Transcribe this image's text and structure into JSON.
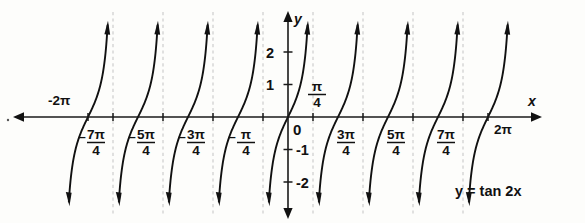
{
  "figure": {
    "title": "",
    "equation_label": "y = tan 2x",
    "axis_labels": {
      "x": "x",
      "y": "y"
    },
    "origin_label": "0"
  },
  "chart_data": {
    "type": "line",
    "title": "",
    "subtitle": "",
    "function": "y = tan 2x",
    "xlabel": "x",
    "ylabel": "y",
    "xlim": [
      -6.9115,
      6.9115
    ],
    "ylim": [
      -2.9,
      2.9
    ],
    "grid": false,
    "legend": null,
    "annotations": [
      "y = tan 2x"
    ],
    "x_ticks": [
      {
        "value": -6.2832,
        "label": "-2π",
        "kind": "whole",
        "sign": "-",
        "text": "2π",
        "on_axis": true
      },
      {
        "value": -5.4978,
        "label": "-7π/4",
        "kind": "fraction",
        "sign": "-",
        "numerator": "7π",
        "denominator": "4"
      },
      {
        "value": -3.927,
        "label": "-5π/4",
        "kind": "fraction",
        "sign": "-",
        "numerator": "5π",
        "denominator": "4"
      },
      {
        "value": -2.3562,
        "label": "-3π/4",
        "kind": "fraction",
        "sign": "-",
        "numerator": "3π",
        "denominator": "4"
      },
      {
        "value": -0.7854,
        "label": "-π/4",
        "kind": "fraction",
        "sign": "-",
        "numerator": "π",
        "denominator": "4"
      },
      {
        "value": 0.7854,
        "label": "π/4",
        "kind": "fraction",
        "sign": "",
        "numerator": "π",
        "denominator": "4"
      },
      {
        "value": 2.3562,
        "label": "3π/4",
        "kind": "fraction",
        "sign": "",
        "numerator": "3π",
        "denominator": "4"
      },
      {
        "value": 3.927,
        "label": "5π/4",
        "kind": "fraction",
        "sign": "",
        "numerator": "5π",
        "denominator": "4"
      },
      {
        "value": 5.4978,
        "label": "7π/4",
        "kind": "fraction",
        "sign": "",
        "numerator": "7π",
        "denominator": "4"
      },
      {
        "value": 6.2832,
        "label": "2π",
        "kind": "whole",
        "sign": "",
        "text": "2π",
        "on_axis": true
      }
    ],
    "y_ticks": [
      {
        "value": 2,
        "label": "2"
      },
      {
        "value": 1,
        "label": "1"
      },
      {
        "value": -1,
        "label": "-1"
      },
      {
        "value": -2,
        "label": "-2"
      }
    ],
    "asymptotes": [
      -5.4978,
      -3.927,
      -2.3562,
      -0.7854,
      0.7854,
      2.3562,
      3.927,
      5.4978
    ],
    "branch_centers": [
      -6.2832,
      -4.7124,
      -3.1416,
      -1.5708,
      0,
      1.5708,
      3.1416,
      4.7124,
      6.2832
    ],
    "colors": {
      "curve": "#111111",
      "axis": "#1a1a1a",
      "asymptote": "#c9c9c9",
      "background": "#fdfdfb",
      "text": "#111111"
    }
  }
}
